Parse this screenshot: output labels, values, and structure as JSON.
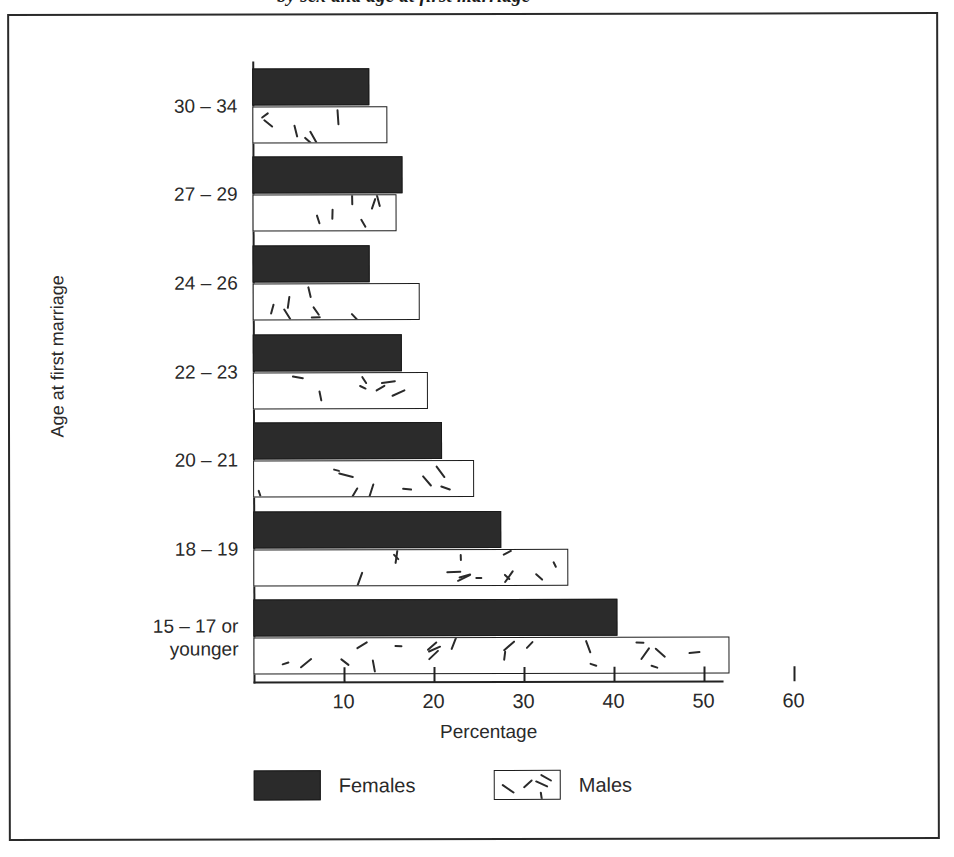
{
  "figure": {
    "title_remnant": "by sex and age at first marriage"
  },
  "chart_data": {
    "type": "bar",
    "orientation": "horizontal",
    "title": "",
    "xlabel": "Percentage",
    "ylabel": "Age at first marriage",
    "categories": [
      "30 – 34",
      "27 – 29",
      "24 – 26",
      "22 – 23",
      "20 – 21",
      "18 – 19",
      "15 – 17 or\nyounger"
    ],
    "series": [
      {
        "name": "Females",
        "color": "#2b2b2b",
        "values": [
          13.0,
          16.7,
          13.0,
          16.5,
          21.0,
          27.5,
          40.4
        ]
      },
      {
        "name": "Males",
        "color": "#ffffff",
        "values": [
          15.0,
          16.0,
          18.6,
          19.4,
          24.5,
          35.0,
          52.9
        ]
      }
    ],
    "xlim": [
      0,
      60
    ],
    "xticks": [
      10,
      20,
      30,
      40,
      50,
      60
    ],
    "xtick_labels": [
      "10",
      "20",
      "30",
      "40",
      "50",
      "60"
    ],
    "grid": false,
    "legend_position": "bottom",
    "legend": [
      {
        "label": "Females",
        "swatch": "solid-dark"
      },
      {
        "label": "Males",
        "swatch": "speckled-white"
      }
    ]
  }
}
